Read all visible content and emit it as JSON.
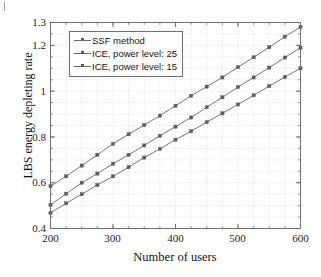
{
  "figure": {
    "background_color": "#ffffff",
    "line_color": "#757575",
    "marker_color": "#5d5d5d",
    "grid_color": "#c8c8c8",
    "axis_color": "#6e6e6e"
  },
  "chart_data": {
    "type": "line",
    "title": "",
    "xlabel": "Number of users",
    "ylabel": "LBS energy depleting rate",
    "xlim": [
      200,
      600
    ],
    "ylim": [
      0.4,
      1.3
    ],
    "xticks": [
      200,
      300,
      400,
      500,
      600
    ],
    "xtick_labels": [
      "200",
      "300",
      "400",
      "500",
      "600"
    ],
    "xminor_step": 25,
    "yticks": [
      0.4,
      0.6,
      0.8,
      1.0,
      1.2,
      1.3
    ],
    "ytick_labels": [
      "0.4",
      "0.6",
      "0.8",
      "1",
      "1.2",
      "1.3"
    ],
    "yminor_step": 0.05,
    "grid": "dotted",
    "legend_position": "upper left",
    "x": [
      200,
      225,
      250,
      275,
      300,
      325,
      350,
      375,
      400,
      425,
      450,
      475,
      500,
      525,
      550,
      575,
      600
    ],
    "series": [
      {
        "name": "SSF method",
        "marker": "square",
        "values": [
          0.585,
          0.628,
          0.675,
          0.722,
          0.77,
          0.812,
          0.852,
          0.893,
          0.936,
          0.98,
          1.02,
          1.06,
          1.105,
          1.148,
          1.192,
          1.238,
          1.28
        ]
      },
      {
        "name": "ICE, power level: 25",
        "marker": "square",
        "values": [
          0.503,
          0.552,
          0.6,
          0.64,
          0.683,
          0.722,
          0.763,
          0.805,
          0.845,
          0.885,
          0.93,
          0.973,
          1.018,
          1.06,
          1.103,
          1.147,
          1.19
        ]
      },
      {
        "name": "ICE, power level: 15",
        "marker": "square",
        "values": [
          0.468,
          0.51,
          0.55,
          0.59,
          0.628,
          0.668,
          0.71,
          0.748,
          0.788,
          0.825,
          0.865,
          0.903,
          0.942,
          0.982,
          1.022,
          1.062,
          1.1
        ]
      }
    ]
  },
  "legend": {
    "items": [
      {
        "label": "SSF method"
      },
      {
        "label": "ICE, power level: 25"
      },
      {
        "label": "ICE, power level: 15"
      }
    ]
  },
  "axes": {
    "ylabel": "LBS energy depleting rate",
    "xlabel": "Number of users",
    "ytick_labels": [
      "1.3",
      "1.2",
      "1",
      "0.8",
      "0.6",
      "0.4"
    ],
    "xtick_labels": [
      "200",
      "300",
      "400",
      "500",
      "600"
    ]
  }
}
